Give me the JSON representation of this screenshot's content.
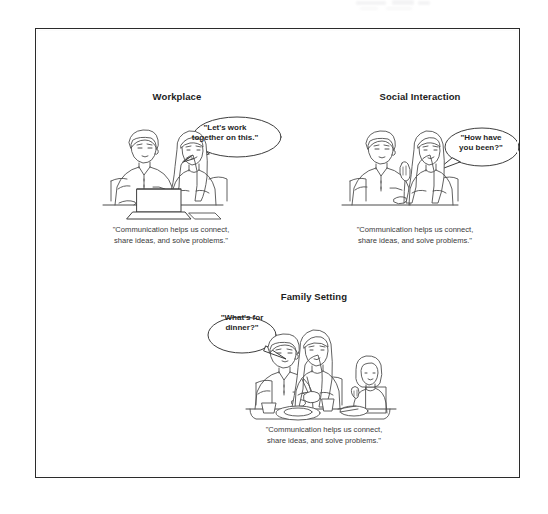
{
  "page": {
    "background_color": "#ffffff",
    "frame_color": "#2b2b2b",
    "ink_color": "#4a4a4a",
    "text_color": "#1c1c1c",
    "shared_caption": "\"Communication helps us connect,\nshare ideas, and solve problems.\""
  },
  "panels": [
    {
      "id": "workplace",
      "title": "Workplace",
      "speech": "\"Let's work\ntogether on this.\"",
      "caption": "\"Communication helps us connect,\nshare ideas, and solve problems.\"",
      "scene": "two-colleagues-at-laptop"
    },
    {
      "id": "social",
      "title": "Social Interaction",
      "speech": "\"How have\nyou been?\"",
      "caption": "\"Communication helps us connect,\nshare ideas, and solve problems.\"",
      "scene": "two-friends-talking-at-table"
    },
    {
      "id": "family",
      "title": "Family Setting",
      "speech": "\"What's for\ndinner?\"",
      "caption": "\"Communication helps us connect,\nshare ideas, and solve problems.\"",
      "scene": "family-of-three-at-dinner-table"
    }
  ]
}
